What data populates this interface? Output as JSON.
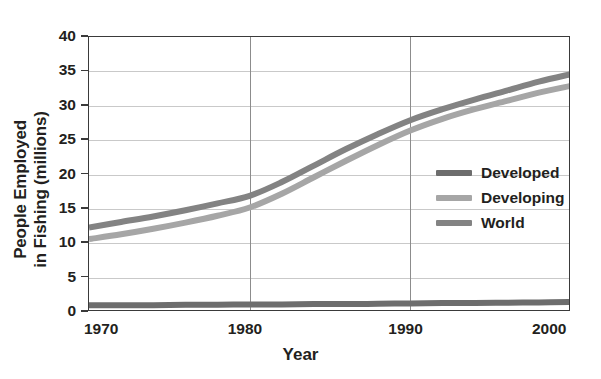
{
  "chart_data": {
    "type": "line",
    "title": "",
    "xlabel": "Year",
    "ylabel": "People Employed in Fishing (millions)",
    "ylabel_line1": "People Employed",
    "ylabel_line2": "in Fishing (millions)",
    "xlim": [
      1970,
      2000
    ],
    "ylim": [
      0,
      40
    ],
    "y_ticks": [
      0,
      5,
      10,
      15,
      20,
      25,
      30,
      35,
      40
    ],
    "y_tick_labels": [
      "0",
      "5",
      "10",
      "15",
      "20",
      "25",
      "30",
      "35",
      "40"
    ],
    "x_ticks": [
      1970,
      1980,
      1990,
      2000
    ],
    "x_tick_labels": [
      "1970",
      "1980",
      "1990",
      "2000"
    ],
    "grid": "horizontal-and-vertical",
    "legend_position": "center-right",
    "x": [
      1970,
      1972,
      1974,
      1976,
      1978,
      1980,
      1982,
      1984,
      1986,
      1988,
      1990,
      1992,
      1994,
      1996,
      1998,
      2000
    ],
    "series": [
      {
        "name": "Developed",
        "color": "#6d6d6d",
        "values": [
          1.0,
          1.0,
          1.0,
          1.05,
          1.05,
          1.1,
          1.1,
          1.15,
          1.15,
          1.2,
          1.25,
          1.3,
          1.3,
          1.35,
          1.4,
          1.45
        ]
      },
      {
        "name": "Developing",
        "color": "#a6a6a6",
        "values": [
          10.6,
          11.3,
          12.1,
          13.0,
          14.0,
          15.2,
          17.2,
          19.6,
          22.0,
          24.3,
          26.4,
          28.1,
          29.5,
          30.7,
          31.9,
          32.9
        ]
      },
      {
        "name": "World",
        "color": "#838383",
        "values": [
          12.3,
          13.1,
          13.9,
          14.8,
          15.8,
          16.9,
          18.9,
          21.3,
          23.7,
          25.9,
          27.9,
          29.5,
          30.9,
          32.2,
          33.5,
          34.6
        ]
      }
    ],
    "legend": [
      {
        "label": "Developed",
        "color": "#6d6d6d"
      },
      {
        "label": "Developing",
        "color": "#a6a6a6"
      },
      {
        "label": "World",
        "color": "#838383"
      }
    ],
    "colors": {
      "axis": "#3a3a3a",
      "hgrid": "#c9c9c9",
      "vgrid": "#8c8c8c",
      "text": "#231f20",
      "background": "#ffffff"
    }
  }
}
